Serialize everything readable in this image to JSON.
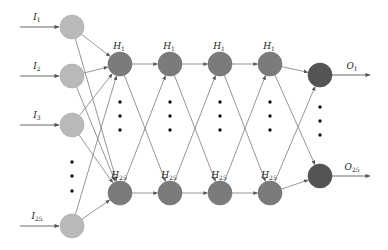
{
  "diagram": {
    "type": "neural-network",
    "colors": {
      "input_node": "#b9b9b9",
      "hidden_node": "#7b7b7b",
      "output_node": "#545454",
      "edge": "#8a8a8a",
      "dot": "#111111"
    },
    "input_layer": {
      "nodes": [
        {
          "label": "I",
          "sub": "1",
          "cx": 72,
          "cy": 27
        },
        {
          "label": "I",
          "sub": "2",
          "cx": 72,
          "cy": 76
        },
        {
          "label": "I",
          "sub": "3",
          "cx": 72,
          "cy": 125
        },
        {
          "label": "I",
          "sub": "25",
          "cx": 72,
          "cy": 226
        }
      ],
      "ellipsis_dots": [
        {
          "x": 72,
          "y": 162
        },
        {
          "x": 72,
          "y": 176
        },
        {
          "x": 72,
          "y": 191
        }
      ]
    },
    "hidden_layers": [
      {
        "x": 120,
        "top": {
          "label": "H",
          "sub": "1"
        },
        "bottom": {
          "label": "H",
          "sub": "25"
        }
      },
      {
        "x": 170,
        "top": {
          "label": "H",
          "sub": "1"
        },
        "bottom": {
          "label": "H",
          "sub": "25"
        }
      },
      {
        "x": 220,
        "top": {
          "label": "H",
          "sub": "1"
        },
        "bottom": {
          "label": "H",
          "sub": "25"
        }
      },
      {
        "x": 270,
        "top": {
          "label": "H",
          "sub": "1"
        },
        "bottom": {
          "label": "H",
          "sub": "25"
        }
      }
    ],
    "hidden_top_y": 64,
    "hidden_bottom_y": 193,
    "hidden_dots_y": [
      102,
      116,
      130
    ],
    "output_layer": {
      "nodes": [
        {
          "label": "O",
          "sub": "1",
          "cx": 320,
          "cy": 75
        },
        {
          "label": "O",
          "sub": "25",
          "cx": 320,
          "cy": 176
        }
      ],
      "ellipsis_dots": [
        {
          "x": 320,
          "y": 107
        },
        {
          "x": 320,
          "y": 121
        },
        {
          "x": 320,
          "y": 135
        }
      ]
    },
    "node_radius": 12
  }
}
